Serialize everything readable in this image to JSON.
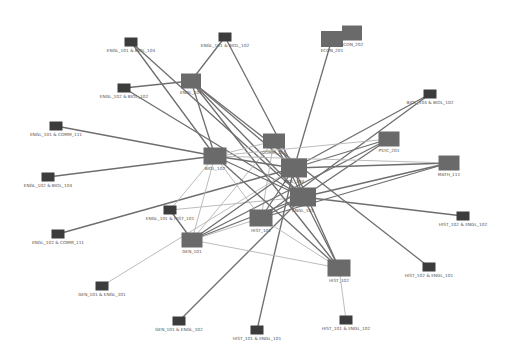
{
  "diagram": {
    "type": "network-graph",
    "colors": {
      "background": "#ffffff",
      "course_node": "#6a6a6a",
      "pair_node": "#3c3c3c",
      "edge_dark": "#6e6e6e",
      "edge_light": "#b4b4b4",
      "label": "#555555"
    },
    "nodes": [
      {
        "id": "engl_101_biol_104",
        "label": "ENGL_101 & BIOL_104",
        "kind": "pair",
        "x": 131,
        "y": 42,
        "w": 13,
        "h": 9
      },
      {
        "id": "engl_101_biol_102",
        "label": "ENGL_101 & BIOL_102",
        "kind": "pair",
        "x": 225,
        "y": 37,
        "w": 13,
        "h": 9
      },
      {
        "id": "engl_102_biol_102",
        "label": "ENGL_102 & BIOL_102",
        "kind": "pair",
        "x": 124,
        "y": 88,
        "w": 13,
        "h": 9
      },
      {
        "id": "engl_101_comm_111",
        "label": "ENGL_101 & COMM_111",
        "kind": "pair",
        "x": 56,
        "y": 126,
        "w": 13,
        "h": 9
      },
      {
        "id": "engl_102_biol_104",
        "label": "ENGL_102 & BIOL_104",
        "kind": "pair",
        "x": 48,
        "y": 177,
        "w": 13,
        "h": 9
      },
      {
        "id": "engl_102_comm_111",
        "label": "ENGL_102 & COMM_111",
        "kind": "pair",
        "x": 58,
        "y": 234,
        "w": 13,
        "h": 9
      },
      {
        "id": "engl_101_hist_101",
        "label": "ENGL_101 & HIST_101",
        "kind": "pair",
        "x": 170,
        "y": 210,
        "w": 13,
        "h": 9
      },
      {
        "id": "gen_101_engl_101",
        "label": "GEN_101 & ENGL_101",
        "kind": "pair",
        "x": 102,
        "y": 286,
        "w": 13,
        "h": 9
      },
      {
        "id": "gen_101_engl_102",
        "label": "GEN_101 & ENGL_102",
        "kind": "pair",
        "x": 179,
        "y": 321,
        "w": 13,
        "h": 9
      },
      {
        "id": "hist_101_engl_101",
        "label": "HIST_101 & ENGL_101",
        "kind": "pair",
        "x": 257,
        "y": 330,
        "w": 13,
        "h": 9
      },
      {
        "id": "hist_101_engl_102",
        "label": "HIST_101 & ENGL_102",
        "kind": "pair",
        "x": 346,
        "y": 320,
        "w": 13,
        "h": 9
      },
      {
        "id": "hist_102_engl_101",
        "label": "HIST_102 & ENGL_101",
        "kind": "pair",
        "x": 429,
        "y": 267,
        "w": 13,
        "h": 9
      },
      {
        "id": "hist_102_engl_102",
        "label": "HIST_102 & ENGL_102",
        "kind": "pair",
        "x": 463,
        "y": 216,
        "w": 13,
        "h": 9
      },
      {
        "id": "biol_104_biol_102",
        "label": "BIOL_104 & BIOL_102",
        "kind": "pair",
        "x": 430,
        "y": 94,
        "w": 13,
        "h": 9
      },
      {
        "id": "engl_101",
        "label": "ENGL_101",
        "kind": "course",
        "x": 191,
        "y": 81,
        "w": 20,
        "h": 15
      },
      {
        "id": "econ_201",
        "label": "ECON_201",
        "kind": "course",
        "x": 332,
        "y": 39,
        "w": 22,
        "h": 16
      },
      {
        "id": "econ_202",
        "label": "ECON_202",
        "kind": "course",
        "x": 352,
        "y": 33,
        "w": 20,
        "h": 15
      },
      {
        "id": "comm_111",
        "label": "COMM_111",
        "kind": "course",
        "x": 274,
        "y": 141,
        "w": 22,
        "h": 15
      },
      {
        "id": "psyc_201",
        "label": "PSYC_201",
        "kind": "course",
        "x": 389,
        "y": 139,
        "w": 21,
        "h": 15
      },
      {
        "id": "math_111",
        "label": "MATH_111",
        "kind": "course",
        "x": 449,
        "y": 163,
        "w": 21,
        "h": 15
      },
      {
        "id": "biol_102",
        "label": "BIOL_102",
        "kind": "course",
        "x": 215,
        "y": 156,
        "w": 23,
        "h": 17
      },
      {
        "id": "biol_104",
        "label": "BIOL_104",
        "kind": "course",
        "x": 294,
        "y": 168,
        "w": 26,
        "h": 19
      },
      {
        "id": "engl_102",
        "label": "ENGL_102",
        "kind": "course",
        "x": 303,
        "y": 197,
        "w": 26,
        "h": 19
      },
      {
        "id": "hist_101",
        "label": "HIST_101",
        "kind": "course",
        "x": 261,
        "y": 218,
        "w": 23,
        "h": 17
      },
      {
        "id": "gen_101",
        "label": "GEN_101",
        "kind": "course",
        "x": 192,
        "y": 240,
        "w": 21,
        "h": 15
      },
      {
        "id": "hist_102",
        "label": "HIST_102",
        "kind": "course",
        "x": 339,
        "y": 268,
        "w": 23,
        "h": 17
      }
    ],
    "edges": [
      {
        "from": "engl_101_biol_104",
        "to": "engl_102",
        "weight": "dark"
      },
      {
        "from": "engl_101_biol_104",
        "to": "biol_102",
        "weight": "dark"
      },
      {
        "from": "engl_101_biol_102",
        "to": "engl_101",
        "weight": "dark"
      },
      {
        "from": "engl_101_biol_102",
        "to": "biol_104",
        "weight": "dark"
      },
      {
        "from": "engl_102_biol_102",
        "to": "engl_101",
        "weight": "dark"
      },
      {
        "from": "engl_102_biol_102",
        "to": "engl_102",
        "weight": "dark"
      },
      {
        "from": "engl_101_comm_111",
        "to": "biol_102",
        "weight": "dark"
      },
      {
        "from": "engl_102_biol_104",
        "to": "biol_102",
        "weight": "dark"
      },
      {
        "from": "engl_102_comm_111",
        "to": "biol_104",
        "weight": "dark"
      },
      {
        "from": "engl_101_hist_101",
        "to": "gen_101",
        "weight": "dark"
      },
      {
        "from": "engl_101_hist_101",
        "to": "engl_102",
        "weight": "light"
      },
      {
        "from": "engl_101_hist_101",
        "to": "biol_102",
        "weight": "light"
      },
      {
        "from": "gen_101_engl_101",
        "to": "biol_104",
        "weight": "light"
      },
      {
        "from": "gen_101_engl_102",
        "to": "engl_102",
        "weight": "dark"
      },
      {
        "from": "hist_101_engl_101",
        "to": "biol_104",
        "weight": "dark"
      },
      {
        "from": "hist_101_engl_102",
        "to": "hist_102",
        "weight": "light"
      },
      {
        "from": "hist_102_engl_101",
        "to": "engl_101",
        "weight": "dark"
      },
      {
        "from": "hist_102_engl_102",
        "to": "engl_102",
        "weight": "dark"
      },
      {
        "from": "biol_104_biol_102",
        "to": "biol_104",
        "weight": "dark"
      },
      {
        "from": "biol_104_biol_102",
        "to": "hist_101",
        "weight": "dark"
      },
      {
        "from": "econ_201",
        "to": "biol_104",
        "weight": "dark"
      },
      {
        "from": "engl_101",
        "to": "biol_102",
        "weight": "dark"
      },
      {
        "from": "engl_101",
        "to": "biol_104",
        "weight": "dark"
      },
      {
        "from": "engl_101",
        "to": "engl_102",
        "weight": "dark"
      },
      {
        "from": "engl_101",
        "to": "hist_102",
        "weight": "dark"
      },
      {
        "from": "comm_111",
        "to": "biol_104",
        "weight": "dark"
      },
      {
        "from": "comm_111",
        "to": "engl_102",
        "weight": "dark"
      },
      {
        "from": "comm_111",
        "to": "biol_102",
        "weight": "light"
      },
      {
        "from": "comm_111",
        "to": "gen_101",
        "weight": "light"
      },
      {
        "from": "comm_111",
        "to": "hist_101",
        "weight": "light"
      },
      {
        "from": "psyc_201",
        "to": "biol_104",
        "weight": "dark"
      },
      {
        "from": "psyc_201",
        "to": "biol_102",
        "weight": "light"
      },
      {
        "from": "psyc_201",
        "to": "gen_101",
        "weight": "dark"
      },
      {
        "from": "psyc_201",
        "to": "engl_102",
        "weight": "dark"
      },
      {
        "from": "math_111",
        "to": "biol_104",
        "weight": "dark"
      },
      {
        "from": "math_111",
        "to": "biol_102",
        "weight": "light"
      },
      {
        "from": "math_111",
        "to": "hist_101",
        "weight": "dark"
      },
      {
        "from": "math_111",
        "to": "engl_102",
        "weight": "dark"
      },
      {
        "from": "biol_102",
        "to": "biol_104",
        "weight": "dark"
      },
      {
        "from": "biol_102",
        "to": "engl_102",
        "weight": "dark"
      },
      {
        "from": "biol_102",
        "to": "hist_101",
        "weight": "light"
      },
      {
        "from": "biol_102",
        "to": "gen_101",
        "weight": "light"
      },
      {
        "from": "biol_102",
        "to": "hist_102",
        "weight": "dark"
      },
      {
        "from": "biol_104",
        "to": "engl_102",
        "weight": "dark"
      },
      {
        "from": "biol_104",
        "to": "hist_101",
        "weight": "dark"
      },
      {
        "from": "biol_104",
        "to": "gen_101",
        "weight": "dark"
      },
      {
        "from": "biol_104",
        "to": "hist_102",
        "weight": "dark"
      },
      {
        "from": "engl_102",
        "to": "hist_101",
        "weight": "dark"
      },
      {
        "from": "engl_102",
        "to": "gen_101",
        "weight": "dark"
      },
      {
        "from": "engl_102",
        "to": "hist_102",
        "weight": "dark"
      },
      {
        "from": "hist_101",
        "to": "gen_101",
        "weight": "light"
      },
      {
        "from": "hist_101",
        "to": "hist_102",
        "weight": "light"
      },
      {
        "from": "gen_101",
        "to": "hist_102",
        "weight": "light"
      }
    ]
  }
}
